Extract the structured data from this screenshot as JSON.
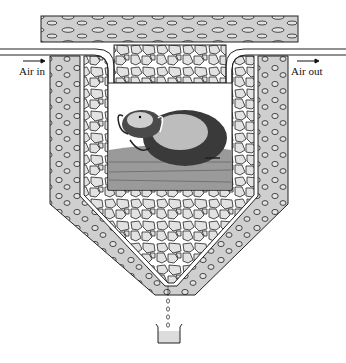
{
  "figure": {
    "labels": {
      "air_in": "Air in",
      "air_out": "Air out"
    },
    "components": [
      "top-cover-slab",
      "air-inlet-tube",
      "air-outlet-tube",
      "outer-insulated-shell",
      "inner-rock-packing",
      "animal-chamber",
      "drip-outlet",
      "collection-beaker"
    ],
    "colors": {
      "shell_fill": "#cfcfcf",
      "rock_fill": "#e2e2e2",
      "outline": "#222222",
      "background": "#ffffff"
    }
  }
}
